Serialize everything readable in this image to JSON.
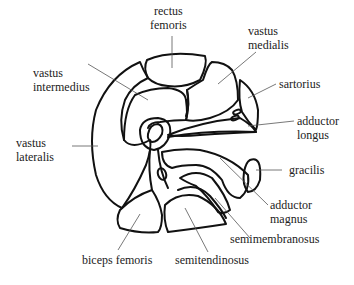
{
  "diagram": {
    "labels": {
      "rectus_femoris": [
        "rectus",
        "femoris"
      ],
      "vastus_medialis": [
        "vastus",
        "medialis"
      ],
      "vastus_intermedius": [
        "vastus",
        "intermedius"
      ],
      "sartorius": "sartorius",
      "adductor_longus": [
        "adductor",
        "longus"
      ],
      "vastus_lateralis": [
        "vastus",
        "lateralis"
      ],
      "gracilis": "gracilis",
      "adductor_magnus": [
        "adductor",
        "magnus"
      ],
      "semimembranosus": "semimembranosus",
      "biceps_femoris": "biceps femoris",
      "semitendinosus": "semitendinosus"
    }
  }
}
